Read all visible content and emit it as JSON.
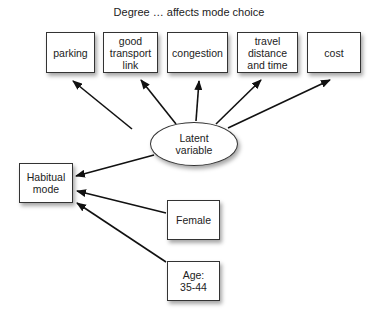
{
  "title": "Degree … affects mode choice",
  "nodes": {
    "parking": "parking",
    "transport": "good\ntransport\nlink",
    "congestion": "congestion",
    "travel": "travel\ndistance\nand time",
    "cost": "cost",
    "latent": "Latent\nvariable",
    "habitual": "Habitual\nmode",
    "female": "Female",
    "age": "Age:\n35-44"
  },
  "edges": [
    {
      "from": "latent",
      "to": "parking"
    },
    {
      "from": "latent",
      "to": "transport"
    },
    {
      "from": "latent",
      "to": "congestion"
    },
    {
      "from": "latent",
      "to": "travel"
    },
    {
      "from": "latent",
      "to": "cost"
    },
    {
      "from": "latent",
      "to": "habitual"
    },
    {
      "from": "female",
      "to": "habitual"
    },
    {
      "from": "age",
      "to": "habitual"
    }
  ]
}
